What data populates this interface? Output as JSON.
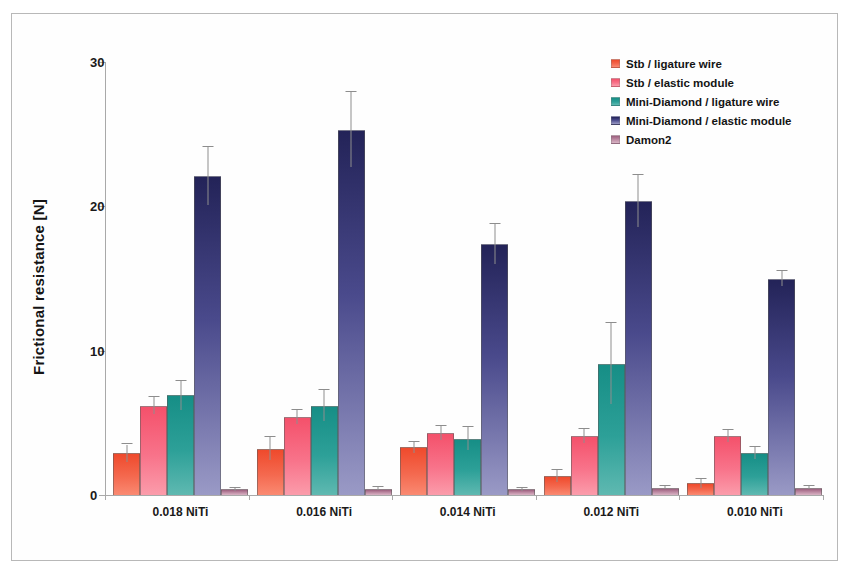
{
  "chart_data": {
    "type": "bar",
    "title": "",
    "subtitle": "",
    "xlabel": "",
    "ylabel": "Frictional resistance [N]",
    "ylim": [
      0,
      30
    ],
    "yticks": [
      0,
      10,
      20,
      30
    ],
    "grid": false,
    "legend_position": "top-right",
    "categories": [
      "0.018 NiTi",
      "0.016 NiTi",
      "0.014 NiTi",
      "0.012 NiTi",
      "0.010 NiTi"
    ],
    "series": [
      {
        "name": "Stb / ligature wire",
        "color": "#f4694f",
        "values": [
          2.9,
          3.2,
          3.3,
          1.3,
          0.8
        ],
        "errors": [
          0.6,
          0.8,
          0.4,
          0.4,
          0.3
        ]
      },
      {
        "name": "Stb / elastic module",
        "color": "#f8738a",
        "values": [
          6.2,
          5.4,
          4.3,
          4.1,
          4.1
        ],
        "errors": [
          0.6,
          0.5,
          0.5,
          0.5,
          0.4
        ]
      },
      {
        "name": "Mini-Diamond / ligature wire",
        "color": "#2da098",
        "values": [
          6.9,
          6.2,
          3.9,
          9.1,
          2.9
        ],
        "errors": [
          1.0,
          1.1,
          0.8,
          2.8,
          0.4
        ]
      },
      {
        "name": "Mini-Diamond / elastic module",
        "color": "#4a4a8c",
        "values": [
          22.1,
          25.3,
          17.4,
          20.4,
          15.0
        ],
        "errors": [
          2.0,
          2.6,
          1.4,
          1.8,
          0.5
        ]
      },
      {
        "name": "Damon2",
        "color": "#bd8aa3",
        "values": [
          0.4,
          0.45,
          0.4,
          0.5,
          0.5
        ],
        "errors": [
          0.1,
          0.1,
          0.1,
          0.1,
          0.1
        ]
      }
    ]
  },
  "axis": {
    "y_title": "Frictional resistance [N]",
    "y_tick_labels": [
      "0",
      "10",
      "20",
      "30"
    ],
    "x_tick_labels": [
      "0.018 NiTi",
      "0.016 NiTi",
      "0.014 NiTi",
      "0.012 NiTi",
      "0.010 NiTi"
    ]
  },
  "legend": {
    "items": [
      {
        "label": "Stb / ligature wire",
        "color": "#f4694f"
      },
      {
        "label": "Stb / elastic module",
        "color": "#f8738a"
      },
      {
        "label": "Mini-Diamond / ligature wire",
        "color": "#2da098"
      },
      {
        "label": "Mini-Diamond / elastic module",
        "color": "#4a4a8c"
      },
      {
        "label": "Damon2",
        "color": "#bd8aa3"
      }
    ]
  }
}
